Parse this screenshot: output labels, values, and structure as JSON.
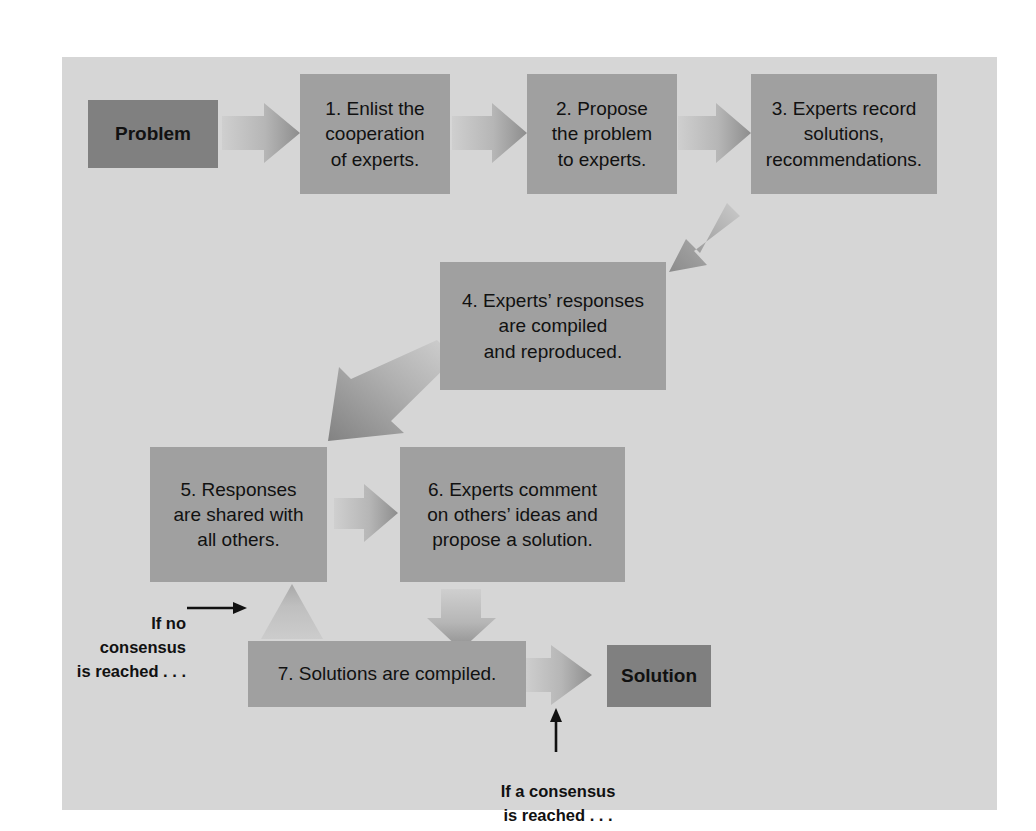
{
  "diagram": {
    "panel_background": "#d6d6d6",
    "page_background": "#ffffff",
    "step_box_color": "#a0a0a0",
    "terminal_box_color": "#808080",
    "arrow_color_light": "#c4c4c4",
    "arrow_color_dark": "#8a8a8a",
    "text_color": "#111111"
  },
  "nodes": {
    "problem": {
      "label": "Problem"
    },
    "step1": {
      "label": "1. Enlist the\ncooperation\nof experts."
    },
    "step2": {
      "label": "2. Propose\nthe problem\nto experts."
    },
    "step3": {
      "label": "3. Experts record\nsolutions,\nrecommendations."
    },
    "step4": {
      "label": "4. Experts’ responses\nare compiled\nand reproduced."
    },
    "step5": {
      "label": "5. Responses\nare shared with\nall others."
    },
    "step6": {
      "label": "6. Experts comment\non others’ ideas and\npropose a solution."
    },
    "step7": {
      "label": "7. Solutions are compiled."
    },
    "solution": {
      "label": "Solution"
    }
  },
  "annotations": {
    "no_consensus": {
      "label": "If no consensus\nis reached . . ."
    },
    "consensus": {
      "label": "If a consensus\nis reached . . ."
    }
  },
  "arrows": [
    {
      "name": "arrow-problem-to-step1",
      "direction": "right"
    },
    {
      "name": "arrow-step1-to-step2",
      "direction": "right"
    },
    {
      "name": "arrow-step2-to-step3",
      "direction": "right"
    },
    {
      "name": "arrow-step3-to-step4",
      "direction": "down-left"
    },
    {
      "name": "arrow-step4-to-step5",
      "direction": "down-left"
    },
    {
      "name": "arrow-step5-to-step6",
      "direction": "right"
    },
    {
      "name": "arrow-step6-to-step7",
      "direction": "down"
    },
    {
      "name": "arrow-step7-to-step5-loop",
      "direction": "up"
    },
    {
      "name": "arrow-step7-to-solution",
      "direction": "right"
    },
    {
      "name": "pointer-no-consensus",
      "direction": "right"
    },
    {
      "name": "pointer-consensus",
      "direction": "up"
    }
  ]
}
